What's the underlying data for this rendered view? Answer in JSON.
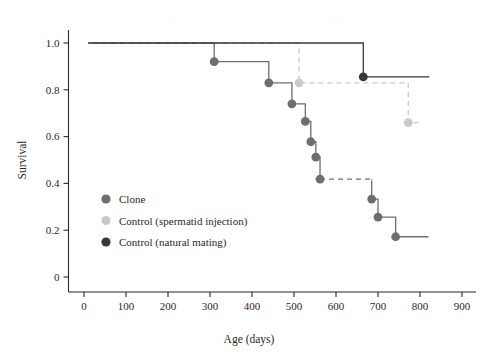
{
  "chart_data": {
    "type": "line",
    "title": "",
    "xlabel": "Age (days)",
    "ylabel": "Survival",
    "xlim": [
      0,
      900
    ],
    "ylim": [
      0,
      1.06
    ],
    "grid": false,
    "legend_position": "inner-left",
    "x_ticks": [
      "0",
      "100",
      "200",
      "300",
      "400",
      "500",
      "600",
      "700",
      "800",
      "900"
    ],
    "x_tick_values": [
      0,
      100,
      200,
      300,
      400,
      500,
      600,
      700,
      800,
      900
    ],
    "y_ticks": [
      "0",
      "0.2",
      "0.4",
      "0.6",
      "0.8",
      "1.0"
    ],
    "y_tick_values": [
      0,
      0.2,
      0.4,
      0.6,
      0.8,
      1.0
    ],
    "series": [
      {
        "name": "Clone",
        "color": "#6e6e6e",
        "line_style": "solid",
        "marker": "circle",
        "steps": [
          {
            "x": 10,
            "y": 1.0
          },
          {
            "x": 310,
            "y": 1.0
          },
          {
            "x": 310,
            "y": 0.92
          },
          {
            "x": 440,
            "y": 0.92
          },
          {
            "x": 440,
            "y": 0.83
          },
          {
            "x": 495,
            "y": 0.83
          },
          {
            "x": 495,
            "y": 0.74
          },
          {
            "x": 527,
            "y": 0.74
          },
          {
            "x": 527,
            "y": 0.665
          },
          {
            "x": 540,
            "y": 0.665
          },
          {
            "x": 540,
            "y": 0.578
          },
          {
            "x": 552,
            "y": 0.578
          },
          {
            "x": 552,
            "y": 0.512
          },
          {
            "x": 562,
            "y": 0.512
          },
          {
            "x": 562,
            "y": 0.418
          },
          {
            "x": 685,
            "y": 0.418
          },
          {
            "x": 685,
            "y": 0.333
          },
          {
            "x": 700,
            "y": 0.333
          },
          {
            "x": 700,
            "y": 0.256
          },
          {
            "x": 742,
            "y": 0.256
          },
          {
            "x": 742,
            "y": 0.172
          },
          {
            "x": 820,
            "y": 0.172
          }
        ],
        "points": [
          {
            "x": 310,
            "y": 0.92
          },
          {
            "x": 440,
            "y": 0.83
          },
          {
            "x": 495,
            "y": 0.74
          },
          {
            "x": 527,
            "y": 0.665
          },
          {
            "x": 540,
            "y": 0.578
          },
          {
            "x": 552,
            "y": 0.512
          },
          {
            "x": 562,
            "y": 0.418
          },
          {
            "x": 685,
            "y": 0.333
          },
          {
            "x": 700,
            "y": 0.256
          },
          {
            "x": 742,
            "y": 0.172
          }
        ],
        "dashed_segments": [
          [
            {
              "x": 562,
              "y": 0.418
            },
            {
              "x": 685,
              "y": 0.418
            }
          ]
        ]
      },
      {
        "name": "Control (spermatid injection)",
        "color": "#c9c9c9",
        "line_style": "dashed",
        "marker": "circle",
        "steps": [
          {
            "x": 10,
            "y": 1.0
          },
          {
            "x": 512,
            "y": 1.0
          },
          {
            "x": 512,
            "y": 0.83
          },
          {
            "x": 772,
            "y": 0.83
          },
          {
            "x": 772,
            "y": 0.66
          },
          {
            "x": 806,
            "y": 0.66
          }
        ],
        "points": [
          {
            "x": 512,
            "y": 0.83
          },
          {
            "x": 772,
            "y": 0.66
          }
        ]
      },
      {
        "name": "Control (natural mating)",
        "color": "#3a3633",
        "line_style": "solid",
        "marker": "circle",
        "steps": [
          {
            "x": 10,
            "y": 1.0
          },
          {
            "x": 665,
            "y": 1.0
          },
          {
            "x": 665,
            "y": 0.855
          },
          {
            "x": 822,
            "y": 0.855
          }
        ],
        "points": [
          {
            "x": 665,
            "y": 0.855
          }
        ]
      }
    ],
    "legend": [
      {
        "label": "Clone",
        "color": "#6e6e6e"
      },
      {
        "label": "Control (spermatid injection)",
        "color": "#c9c9c9"
      },
      {
        "label": "Control (natural mating)",
        "color": "#3a3633"
      }
    ]
  },
  "axes": {
    "x_title": "Age (days)",
    "y_title": "Survival"
  }
}
